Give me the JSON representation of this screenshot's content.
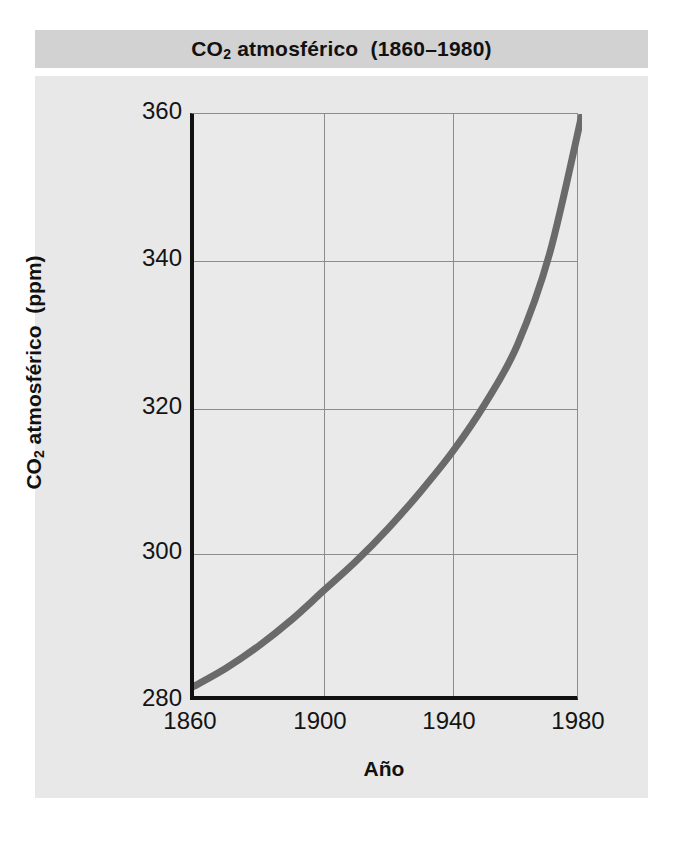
{
  "figure": {
    "title_main": "CO",
    "title_sub": "2",
    "title_rest": " atmosférico  (1860–1980)",
    "banner_color": "#d2d2d2",
    "panel_color": "#e8e8e8"
  },
  "axes": {
    "ylabel_main": "CO",
    "ylabel_sub": "2",
    "ylabel_rest": " atmosférico  (ppm)",
    "xlabel": "Año",
    "yticks": [
      "360",
      "340",
      "320",
      "300",
      "280"
    ],
    "xticks": [
      "1860",
      "1900",
      "1940",
      "1980"
    ]
  },
  "chart_data": {
    "type": "line",
    "title": "CO2 atmosférico (1860–1980)",
    "xlabel": "Año",
    "ylabel": "CO2 atmosférico (ppm)",
    "xlim": [
      1860,
      1980
    ],
    "ylim": [
      280,
      360
    ],
    "xticks": [
      1860,
      1900,
      1940,
      1980
    ],
    "yticks": [
      280,
      300,
      320,
      340,
      360
    ],
    "grid": true,
    "legend": "none",
    "line_color": "#6a6a6a",
    "line_width_px": 7,
    "series": [
      {
        "name": "CO2 atmosférico (ppm)",
        "x": [
          1860,
          1870,
          1880,
          1890,
          1900,
          1910,
          1920,
          1930,
          1940,
          1950,
          1960,
          1970,
          1980
        ],
        "values": [
          282,
          284.5,
          287.5,
          291,
          295,
          299,
          303.5,
          308.5,
          314,
          320.5,
          328.5,
          341,
          360
        ]
      }
    ]
  }
}
